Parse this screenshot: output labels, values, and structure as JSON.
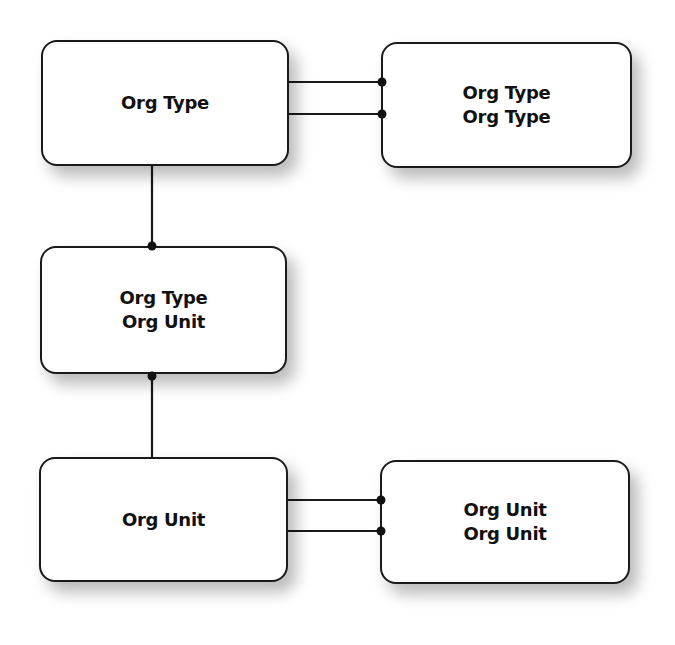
{
  "diagram": {
    "type": "entity-relationship",
    "nodes": [
      {
        "id": "org-type",
        "lines": [
          "Org Type"
        ]
      },
      {
        "id": "org-type-org-type",
        "lines": [
          "Org Type",
          "Org Type"
        ]
      },
      {
        "id": "org-type-org-unit",
        "lines": [
          "Org Type",
          "Org Unit"
        ]
      },
      {
        "id": "org-unit",
        "lines": [
          "Org Unit"
        ]
      },
      {
        "id": "org-unit-org-unit",
        "lines": [
          "Org Unit",
          "Org Unit"
        ]
      }
    ],
    "edges": [
      {
        "from": "org-type",
        "to": "org-type-org-type",
        "end": "dot"
      },
      {
        "from": "org-type",
        "to": "org-type-org-type",
        "end": "dot"
      },
      {
        "from": "org-type",
        "to": "org-type-org-unit",
        "end": "dot"
      },
      {
        "from": "org-unit",
        "to": "org-type-org-unit",
        "end": "dot"
      },
      {
        "from": "org-unit",
        "to": "org-unit-org-unit",
        "end": "dot"
      },
      {
        "from": "org-unit",
        "to": "org-unit-org-unit",
        "end": "dot"
      }
    ]
  }
}
